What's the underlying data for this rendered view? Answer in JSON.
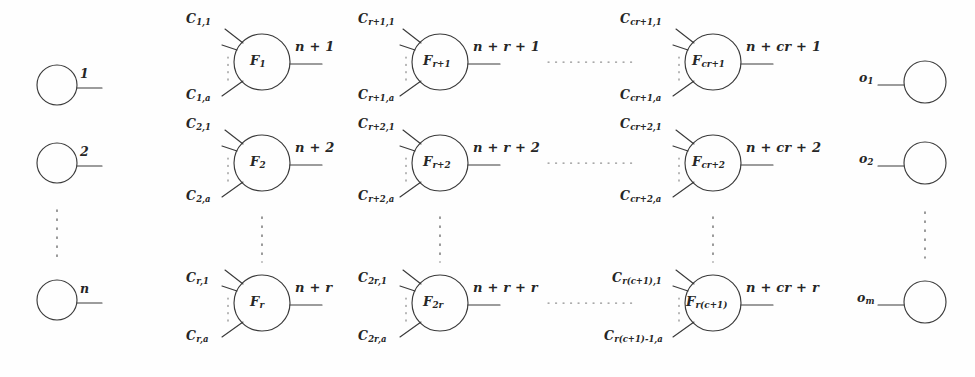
{
  "figure": {
    "type": "network-architecture-diagram",
    "stroke_color": "#3a3a3a",
    "dots_color": "#8d8d8d",
    "background": "#ffffff"
  },
  "input_column": {
    "name": "input-nodes",
    "nodes": [
      {
        "label": "1",
        "cx": 57,
        "cy": 85
      },
      {
        "label": "2",
        "cx": 57,
        "cy": 163
      },
      {
        "label": "n",
        "cx": 57,
        "cy": 300
      }
    ],
    "vertical_ellipsis": {
      "x": 57,
      "y1": 208,
      "y2": 258
    }
  },
  "function_columns": [
    {
      "name": "column-1",
      "cx": 262,
      "rows": [
        {
          "cy": 62,
          "f_label": "F",
          "f_sub": "1",
          "in_top": "C",
          "in_top_sub": "1,1",
          "in_bottom": "C",
          "in_bottom_sub": "1,a",
          "out_prefix": "n",
          "out_op": " + ",
          "out_suffix": "1",
          "out_text": "n + 1"
        },
        {
          "cy": 163,
          "f_label": "F",
          "f_sub": "2",
          "in_top": "C",
          "in_top_sub": "2,1",
          "in_bottom": "C",
          "in_bottom_sub": "2,a",
          "out_prefix": "n",
          "out_op": " + ",
          "out_suffix": "2",
          "out_text": "n + 2"
        },
        {
          "cy": 303,
          "f_label": "F",
          "f_sub": "r",
          "in_top": "C",
          "in_top_sub": "r,1",
          "in_bottom": "C",
          "in_bottom_sub": "r,a",
          "out_prefix": "n",
          "out_op": " + ",
          "out_suffix": "r",
          "out_text": "n + r"
        }
      ],
      "vertical_ellipsis": {
        "x": 262,
        "y1": 215,
        "y2": 262
      }
    },
    {
      "name": "column-2",
      "cx": 440,
      "rows": [
        {
          "cy": 62,
          "f_label": "F",
          "f_sub": "r+1",
          "in_top": "C",
          "in_top_sub": "r+1,1",
          "in_bottom": "C",
          "in_bottom_sub": "r+1,a",
          "out_text": "n + r + 1"
        },
        {
          "cy": 163,
          "f_label": "F",
          "f_sub": "r+2",
          "in_top": "C",
          "in_top_sub": "r+2,1",
          "in_bottom": "C",
          "in_bottom_sub": "r+2,a",
          "out_text": "n + r + 2"
        },
        {
          "cy": 303,
          "f_label": "F",
          "f_sub": "2r",
          "in_top": "C",
          "in_top_sub": "2r,1",
          "in_bottom": "C",
          "in_bottom_sub": "2r,a",
          "out_text": "n + r + r"
        }
      ],
      "vertical_ellipsis": {
        "x": 440,
        "y1": 215,
        "y2": 262
      }
    },
    {
      "name": "column-last",
      "cx": 713,
      "rows": [
        {
          "cy": 62,
          "f_label": "F",
          "f_sub": "cr+1",
          "in_top": "C",
          "in_top_sub": "cr+1,1",
          "in_bottom": "C",
          "in_bottom_sub": "cr+1,a",
          "out_text": "n + cr + 1"
        },
        {
          "cy": 163,
          "f_label": "F",
          "f_sub": "cr+2",
          "in_top": "C",
          "in_top_sub": "cr+2,1",
          "in_bottom": "C",
          "in_bottom_sub": "cr+2,a",
          "out_text": "n + cr + 2"
        },
        {
          "cy": 303,
          "f_label": "F",
          "f_sub": "r(c+1)",
          "in_top": "C",
          "in_top_sub": "r(c+1),1",
          "in_bottom": "C",
          "in_bottom_sub": "r(c+1)-1,a",
          "out_text": "n + cr + r"
        }
      ],
      "vertical_ellipsis": {
        "x": 713,
        "y1": 215,
        "y2": 262
      }
    }
  ],
  "horizontal_ellipses": [
    {
      "name": "row-1-gap",
      "y": 62,
      "x1": 548,
      "x2": 632
    },
    {
      "name": "row-2-gap",
      "y": 163,
      "x1": 548,
      "x2": 632
    },
    {
      "name": "row-3-gap",
      "y": 303,
      "x1": 548,
      "x2": 632
    }
  ],
  "output_column": {
    "name": "output-nodes",
    "nodes": [
      {
        "label": "o",
        "sub": "1",
        "cx": 925,
        "cy": 82
      },
      {
        "label": "o",
        "sub": "2",
        "cx": 925,
        "cy": 163
      },
      {
        "label": "o",
        "sub": "m",
        "cx": 925,
        "cy": 302
      }
    ],
    "vertical_ellipsis": {
      "x": 925,
      "y1": 212,
      "y2": 258
    }
  },
  "geometry": {
    "input_radius": 20,
    "function_radius": 28,
    "output_radius": 21,
    "input_stub_length": 26,
    "output_stub_length": 32,
    "output_wire_length": 26,
    "arm_length": 24
  }
}
